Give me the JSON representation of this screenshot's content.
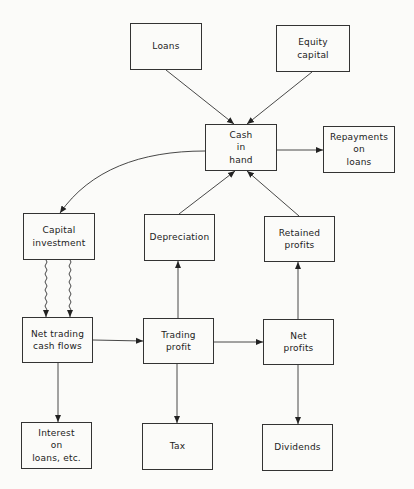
{
  "diagram": {
    "type": "flowchart",
    "title": "",
    "nodes": {
      "loans": "Loans",
      "equity_capital": "Equity\ncapital",
      "cash_in_hand": "Cash\nin\nhand",
      "repayments_on_loans": "Repayments\non\nloans",
      "capital_investment": "Capital\ninvestment",
      "depreciation": "Depreciation",
      "retained_profits": "Retained\nprofits",
      "net_trading_cash_flows": "Net trading\ncash flows",
      "trading_profit": "Trading\nprofit",
      "net_profits": "Net\nprofits",
      "interest_on_loans": "Interest\non\nloans, etc.",
      "tax": "Tax",
      "dividends": "Dividends"
    },
    "edges": [
      {
        "from": "Loans",
        "to": "Cash in hand",
        "style": "solid"
      },
      {
        "from": "Equity capital",
        "to": "Cash in hand",
        "style": "solid"
      },
      {
        "from": "Cash in hand",
        "to": "Repayments on loans",
        "style": "solid"
      },
      {
        "from": "Cash in hand",
        "to": "Capital investment",
        "style": "curved"
      },
      {
        "from": "Depreciation",
        "to": "Cash in hand",
        "style": "solid"
      },
      {
        "from": "Retained profits",
        "to": "Cash in hand",
        "style": "solid"
      },
      {
        "from": "Capital investment",
        "to": "Net trading cash flows",
        "style": "wavy (x2)"
      },
      {
        "from": "Net trading cash flows",
        "to": "Trading profit",
        "style": "solid"
      },
      {
        "from": "Trading profit",
        "to": "Net profits",
        "style": "solid"
      },
      {
        "from": "Trading profit",
        "to": "Depreciation",
        "style": "solid"
      },
      {
        "from": "Net profits",
        "to": "Retained profits",
        "style": "solid"
      },
      {
        "from": "Net trading cash flows",
        "to": "Interest on loans, etc.",
        "style": "solid"
      },
      {
        "from": "Trading profit",
        "to": "Tax",
        "style": "solid"
      },
      {
        "from": "Net profits",
        "to": "Dividends",
        "style": "solid"
      }
    ]
  }
}
